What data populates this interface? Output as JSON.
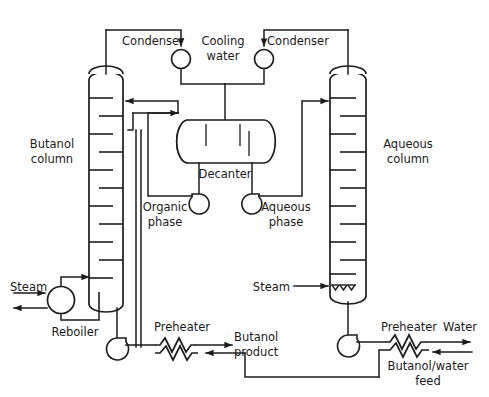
{
  "diagram": {
    "type": "process-flow-diagram",
    "background": "#ffffff",
    "line_color": "#1d1d1d",
    "width": 489,
    "height": 397
  },
  "labels": {
    "condenser_left": "Condenser",
    "cooling_water": "Cooling",
    "cooling_water2": "water",
    "condenser_right": "Condenser",
    "butanol_column1": "Butanol",
    "butanol_column2": "column",
    "aqueous_column1": "Aqueous",
    "aqueous_column2": "column",
    "decanter": "Decanter",
    "organic_phase1": "Organic",
    "organic_phase2": "phase",
    "aqueous_phase1": "Aqueous",
    "aqueous_phase2": "phase",
    "steam_left": "Steam",
    "steam_right": "Steam",
    "reboiler": "Reboiler",
    "preheater_left": "Preheater",
    "preheater_right": "Preheater",
    "butanol_product1": "Butanol",
    "butanol_product2": "product",
    "water": "Water",
    "feed1": "Butanol/water",
    "feed2": "feed"
  },
  "equipment": [
    {
      "name": "butanol-column",
      "kind": "distillation-column",
      "trays": 9
    },
    {
      "name": "aqueous-column",
      "kind": "distillation-column",
      "trays": 10
    },
    {
      "name": "decanter",
      "kind": "horizontal-drum"
    },
    {
      "name": "condenser-left",
      "kind": "circle"
    },
    {
      "name": "condenser-right",
      "kind": "circle"
    },
    {
      "name": "reboiler",
      "kind": "circle"
    },
    {
      "name": "organic-phase-pump",
      "kind": "centrifugal-pump"
    },
    {
      "name": "aqueous-phase-pump",
      "kind": "centrifugal-pump"
    },
    {
      "name": "butanol-bottoms-pump",
      "kind": "centrifugal-pump"
    },
    {
      "name": "water-bottoms-pump",
      "kind": "centrifugal-pump"
    },
    {
      "name": "preheater-left",
      "kind": "zigzag-heat-exchanger"
    },
    {
      "name": "preheater-right",
      "kind": "zigzag-heat-exchanger"
    }
  ]
}
